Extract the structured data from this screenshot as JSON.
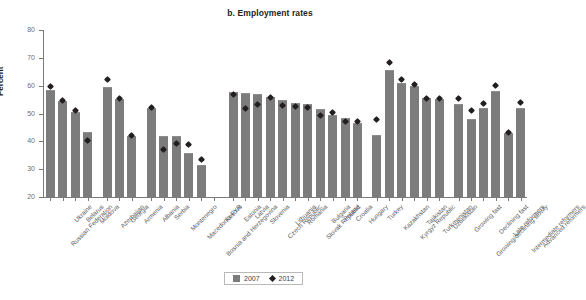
{
  "chart_data": {
    "type": "bar",
    "title": "b. Employment rates",
    "xlabel": "",
    "ylabel": "Percent",
    "ylim": [
      20,
      80
    ],
    "yticks": [
      20,
      30,
      40,
      50,
      60,
      70,
      80
    ],
    "grid": false,
    "legend_position": "bottom-center",
    "categories": [
      "Russian Federation",
      "Ukraine",
      "Belarus",
      "Moldova",
      "Azerbaijan",
      "Georgia",
      "Armenia",
      "Albania",
      "Serbia",
      "Montenegro",
      "Macedonia FYR",
      "Bosnia and Herzegovina",
      "Kosovo",
      "Estonia",
      "Latvia",
      "Slovenia",
      "Czech Republic",
      "Lithuania",
      "Romania",
      "Slovak Republic",
      "Bulgaria",
      "Poland",
      "Croatia",
      "Hungary",
      "Turkey",
      "Kazakhstan",
      "Kyrgyz Republic",
      "Tajikistan",
      "Turkmenistan",
      "Uzbekistan",
      "Growing fast",
      "Growing/declining slowly",
      "Declining fast",
      "Late reformers",
      "Intermediate reformers",
      "Advanced reformers"
    ],
    "series": [
      {
        "name": "2007",
        "marker": "bar",
        "color": "#7c7c7c",
        "values": [
          58.4,
          54.6,
          50.6,
          43.4,
          59.4,
          55.2,
          41.8,
          52.1,
          42.0,
          42.0,
          35.7,
          31.5,
          null,
          57.9,
          57.2,
          57.1,
          56.0,
          54.7,
          53.8,
          53.3,
          51.5,
          49.6,
          48.3,
          46.5,
          42.3,
          65.5,
          61.0,
          59.8,
          55.5,
          55.3,
          53.5,
          48.0,
          52.0,
          58.0,
          43.0,
          52.0
        ]
      },
      {
        "name": "2012",
        "marker": "diamond",
        "color": "#231f20",
        "values": [
          59.7,
          54.7,
          51.1,
          40.2,
          62.2,
          55.4,
          42.0,
          52.3,
          37.0,
          39.4,
          38.8,
          33.5,
          null,
          56.8,
          51.8,
          53.2,
          55.7,
          52.9,
          52.4,
          52.0,
          49.3,
          50.2,
          47.1,
          47.0,
          48.0,
          68.3,
          62.1,
          60.5,
          55.5,
          55.4,
          55.3,
          51.0,
          53.5,
          60.0,
          43.0,
          54.0
        ]
      }
    ],
    "group_breaks_after": [
      3,
      6,
      12,
      23,
      29
    ],
    "legend": [
      {
        "label": "2007",
        "marker": "square",
        "color": "#7c7c7c"
      },
      {
        "label": "2012",
        "marker": "diamond",
        "color": "#231f20"
      }
    ]
  }
}
